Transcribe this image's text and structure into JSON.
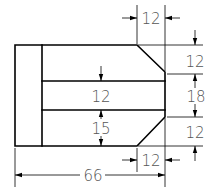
{
  "drawing": {
    "type": "engineering-dimension-drawing",
    "dimensions": {
      "top_chamfer_width": "12",
      "top_chamfer_height": "12",
      "middle_height_right": "18",
      "bottom_chamfer_height": "12",
      "bottom_chamfer_width": "12",
      "inner_band_height": "12",
      "inner_lower_height": "15",
      "overall_length": "66"
    },
    "colors": {
      "line": "#000000",
      "text": "#555555",
      "background": "#ffffff"
    }
  }
}
